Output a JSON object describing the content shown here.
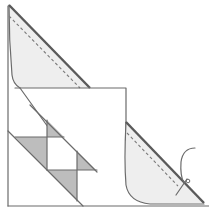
{
  "diagram": {
    "title": "",
    "colors": {
      "outline": "#6b6b6b",
      "flap_fill": "#eeeeee",
      "block_fill": "#bdbdbd",
      "background": "#ffffff"
    },
    "elements": [
      {
        "name": "top-left-folded-flap",
        "style": "shaded-light",
        "has_dashed_seam": true
      },
      {
        "name": "bottom-right-folded-flap",
        "style": "shaded-light",
        "has_dashed_seam": true
      },
      {
        "name": "center-square-flap",
        "style": "outline"
      },
      {
        "name": "hourglass-block",
        "style": "shaded-dark",
        "shaded_triangles": 4
      },
      {
        "name": "thread-curve",
        "style": "outline"
      },
      {
        "name": "pin-marker",
        "style": "outline"
      }
    ],
    "labels": []
  }
}
